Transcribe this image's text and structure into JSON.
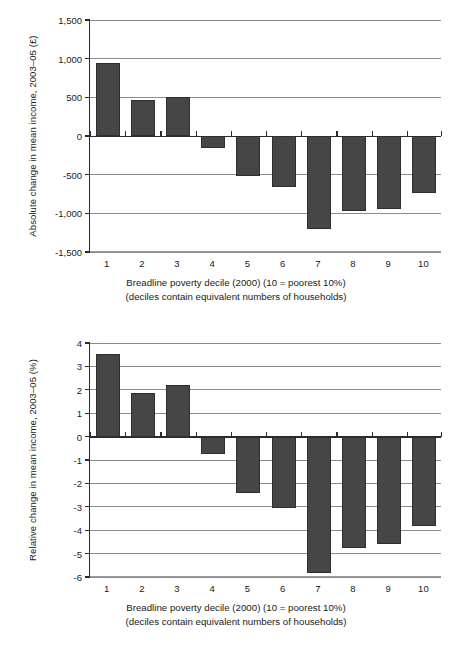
{
  "chart_data": [
    {
      "id": "top",
      "type": "bar",
      "title": "",
      "ylabel": "Absolute change in mean income, 2003–05 (£)",
      "xlabel_lines": [
        "Breadline poverty decile (2000) (10 = poorest 10%)",
        "(deciles contain equivalent numbers of households)"
      ],
      "categories": [
        "1",
        "2",
        "3",
        "4",
        "5",
        "6",
        "7",
        "8",
        "9",
        "10"
      ],
      "values": [
        940,
        470,
        510,
        -160,
        -520,
        -660,
        -1200,
        -970,
        -940,
        -740
      ],
      "ylim": [
        -1500,
        1500
      ],
      "yticks": [
        1500,
        1000,
        500,
        0,
        -500,
        -1000,
        -1500
      ],
      "ytick_labels": [
        "1,500",
        "1,000",
        "500",
        "0",
        "-500",
        "-1,000",
        "-1,500"
      ],
      "grid": true,
      "legend": "none",
      "bar_color": "#464646"
    },
    {
      "id": "bottom",
      "type": "bar",
      "title": "",
      "ylabel": "Relative change in mean income, 2003–05 (%)",
      "xlabel_lines": [
        "Breadline poverty decile (2000) (10 = poorest 10%)",
        "(deciles contain equivalent numbers of households)"
      ],
      "categories": [
        "1",
        "2",
        "3",
        "4",
        "5",
        "6",
        "7",
        "8",
        "9",
        "10"
      ],
      "values": [
        3.55,
        1.85,
        2.2,
        -0.75,
        -2.4,
        -3.05,
        -5.85,
        -4.75,
        -4.6,
        -3.8
      ],
      "ylim": [
        -6,
        4
      ],
      "yticks": [
        4,
        3,
        2,
        1,
        0,
        -1,
        -2,
        -3,
        -4,
        -5,
        -6
      ],
      "ytick_labels": [
        "4",
        "3",
        "2",
        "1",
        "0",
        "-1",
        "-2",
        "-3",
        "-4",
        "-5",
        "-6"
      ],
      "grid": true,
      "legend": "none",
      "bar_color": "#464646"
    }
  ]
}
